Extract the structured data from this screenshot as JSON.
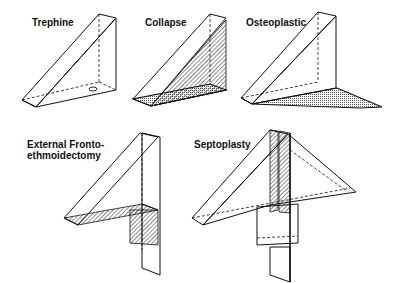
{
  "figure": {
    "panels": [
      {
        "id": "trephine",
        "label": "Trephine"
      },
      {
        "id": "collapse",
        "label": "Collapse"
      },
      {
        "id": "osteoplastic",
        "label": "Osteoplastic"
      },
      {
        "id": "external-frontoethmoidectomy",
        "label": "External Fronto-\nethmoidectomy"
      },
      {
        "id": "septoplasty",
        "label": "Septoplasty"
      }
    ]
  }
}
